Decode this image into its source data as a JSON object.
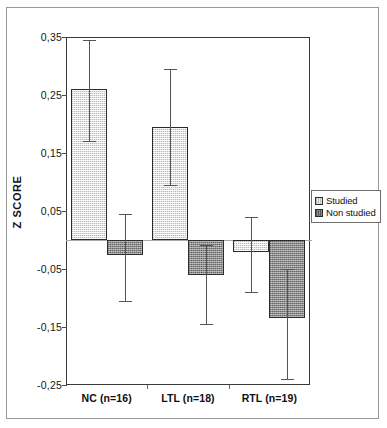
{
  "chart_data": {
    "type": "bar",
    "title": "",
    "xlabel": "",
    "ylabel": "Z SCORE",
    "categories": [
      "NC (n=16)",
      "LTL (n=18)",
      "RTL (n=19)"
    ],
    "ylim": [
      -0.25,
      0.35
    ],
    "ytick_labels": [
      "0,35",
      "0,25",
      "0,15",
      "0,05",
      "-0,05",
      "-0,15",
      "-0,25"
    ],
    "ytick_values": [
      0.35,
      0.25,
      0.15,
      0.05,
      -0.05,
      -0.15,
      -0.25
    ],
    "grid": false,
    "zero_line": true,
    "legend_position": "right-outside",
    "series": [
      {
        "name": "Studied",
        "values": [
          0.26,
          0.195,
          -0.02
        ],
        "err_low": [
          0.17,
          0.095,
          -0.09
        ],
        "err_high": [
          0.345,
          0.295,
          0.04
        ],
        "fill": "#e4e4e4"
      },
      {
        "name": "Non studied",
        "values": [
          -0.025,
          -0.06,
          -0.135
        ],
        "err_low": [
          -0.105,
          -0.145,
          -0.24
        ],
        "err_high": [
          0.045,
          -0.008,
          -0.05
        ],
        "fill": "#8d8d8d"
      }
    ]
  },
  "legend": {
    "items": [
      {
        "label": "Studied",
        "swatch": "legend-swatch-studied"
      },
      {
        "label": "Non studied",
        "swatch": "legend-swatch-nonstudied"
      }
    ]
  },
  "colors": {
    "bar_studied": "#e4e4e4",
    "bar_nonstudied": "#8d8d8d",
    "bar_edge": "#2b2b2b",
    "axis": "#3a3a3a",
    "error_bar": "#555555",
    "zero_line": "#a8a8a8",
    "frame": "#9a9a9a"
  }
}
